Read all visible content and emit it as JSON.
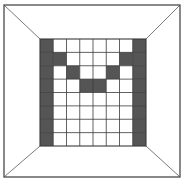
{
  "scene": {
    "title": "Perspective room with patterned back wall",
    "canvas": {
      "width": 185,
      "height": 182
    },
    "colors": {
      "background": "#ffffff",
      "wall_fill": "#ffffff",
      "cell_dark": "#555555",
      "cell_light": "#ffffff",
      "grid_line": "#3a3a3a",
      "outer_border": "#4a4a4a",
      "perspective_line": "#6b6b6b"
    },
    "outer_frame": {
      "label": "outer-border-rectangle",
      "x": 4,
      "y": 5,
      "width": 176,
      "height": 172
    },
    "back_wall": {
      "label": "back-wall-grid-panel",
      "x": 40,
      "y": 39,
      "width": 106,
      "height": 107,
      "columns": 8,
      "rows": 8
    },
    "perspective_lines": [
      {
        "name": "diagonal-top-left",
        "x1": 4,
        "y1": 5,
        "x2": 40,
        "y2": 39
      },
      {
        "name": "diagonal-top-right",
        "x1": 180,
        "y1": 5,
        "x2": 146,
        "y2": 39
      },
      {
        "name": "diagonal-bottom-left",
        "x1": 4,
        "y1": 177,
        "x2": 40,
        "y2": 146
      },
      {
        "name": "diagonal-bottom-right",
        "x1": 180,
        "y1": 177,
        "x2": 146,
        "y2": 146
      }
    ]
  },
  "chart_data": {
    "type": "heatmap",
    "xlabel": "",
    "ylabel": "",
    "columns": [
      "c1",
      "c2",
      "c3",
      "c4",
      "c5",
      "c6",
      "c7",
      "c8"
    ],
    "rows": [
      "r1",
      "r2",
      "r3",
      "r4",
      "r5",
      "r6",
      "r7",
      "r8"
    ],
    "legend": [
      {
        "value": 1,
        "label": "dark cell",
        "color": "#555555"
      },
      {
        "value": 0,
        "label": "light cell",
        "color": "#ffffff"
      }
    ],
    "grid": true,
    "values": [
      [
        1,
        0,
        0,
        0,
        0,
        0,
        0,
        1
      ],
      [
        1,
        1,
        0,
        0,
        0,
        0,
        1,
        1
      ],
      [
        1,
        0,
        1,
        0,
        0,
        1,
        0,
        1
      ],
      [
        1,
        0,
        0,
        1,
        1,
        0,
        0,
        1
      ],
      [
        1,
        0,
        0,
        0,
        0,
        0,
        0,
        1
      ],
      [
        1,
        0,
        0,
        0,
        0,
        0,
        0,
        1
      ],
      [
        1,
        0,
        0,
        0,
        0,
        0,
        0,
        1
      ],
      [
        1,
        0,
        0,
        0,
        0,
        0,
        0,
        1
      ]
    ]
  }
}
